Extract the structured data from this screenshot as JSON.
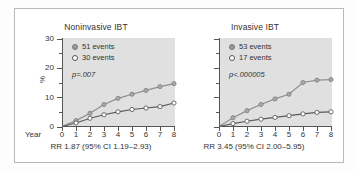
{
  "figure": {
    "y_axis_title": "%",
    "x_axis_name": "Year"
  },
  "panels": [
    {
      "id": "noninvasive",
      "title": "Noninvasive IBT",
      "legend": [
        {
          "marker": "filled-dot",
          "label": "51 events"
        },
        {
          "marker": "open-dot",
          "label": "30 events"
        }
      ],
      "p_value": "p=.007",
      "rr_text": "RR 1.87 (95% CI 1.19–2.93)"
    },
    {
      "id": "invasive",
      "title": "Invasive IBT",
      "legend": [
        {
          "marker": "filled-dot",
          "label": "53 events"
        },
        {
          "marker": "open-dot",
          "label": "17 events"
        }
      ],
      "p_value": "p<.000005",
      "rr_text": "RR 3.45 (95% CI 2.00–5.95)"
    }
  ],
  "axes": {
    "y_ticks": [
      "0",
      "10",
      "20",
      "30"
    ],
    "y_tick_values": [
      0,
      10,
      20,
      30
    ],
    "y_minor_values": [
      5,
      15,
      25
    ],
    "x_ticks": [
      "0",
      "1",
      "2",
      "3",
      "4",
      "5",
      "6",
      "7",
      "8"
    ],
    "y_range": [
      0,
      30
    ],
    "x_range": [
      0,
      8
    ]
  },
  "colors": {
    "plot_background": "#e0e0e0",
    "axis": "#555555",
    "upper_series": "#8f8f8f",
    "lower_series": "#5a5a5a",
    "frame": "#b9b9b9"
  },
  "chart_data": [
    {
      "type": "line",
      "title": "Noninvasive IBT",
      "xlabel": "Year",
      "ylabel": "%",
      "xlim": [
        0,
        8
      ],
      "ylim": [
        0,
        30
      ],
      "grid": false,
      "legend_position": "top-left",
      "x": [
        0,
        1,
        2,
        3,
        4,
        5,
        6,
        7,
        8
      ],
      "series": [
        {
          "name": "51 events",
          "marker": "filled-dot",
          "values": [
            0,
            2.0,
            4.5,
            7.5,
            9.6,
            11.0,
            12.3,
            13.6,
            14.6
          ]
        },
        {
          "name": "30 events",
          "marker": "open-dot",
          "values": [
            0,
            1.2,
            2.8,
            4.0,
            5.0,
            5.8,
            6.3,
            6.8,
            8.0
          ]
        }
      ],
      "annotations": [
        "p=.007",
        "RR 1.87 (95% CI 1.19–2.93)"
      ]
    },
    {
      "type": "line",
      "title": "Invasive IBT",
      "xlabel": "Year",
      "ylabel": "%",
      "xlim": [
        0,
        8
      ],
      "ylim": [
        0,
        30
      ],
      "grid": false,
      "legend_position": "top-left",
      "x": [
        0,
        1,
        2,
        3,
        4,
        5,
        6,
        7,
        8
      ],
      "series": [
        {
          "name": "53 events",
          "marker": "filled-dot",
          "values": [
            0,
            3.0,
            5.4,
            7.5,
            9.4,
            11.0,
            15.0,
            15.8,
            16.0
          ]
        },
        {
          "name": "17 events",
          "marker": "open-dot",
          "values": [
            0,
            1.0,
            1.8,
            2.5,
            3.1,
            3.7,
            4.3,
            4.8,
            5.0
          ]
        }
      ],
      "annotations": [
        "p<.000005",
        "RR 3.45 (95% CI 2.00–5.95)"
      ]
    }
  ]
}
